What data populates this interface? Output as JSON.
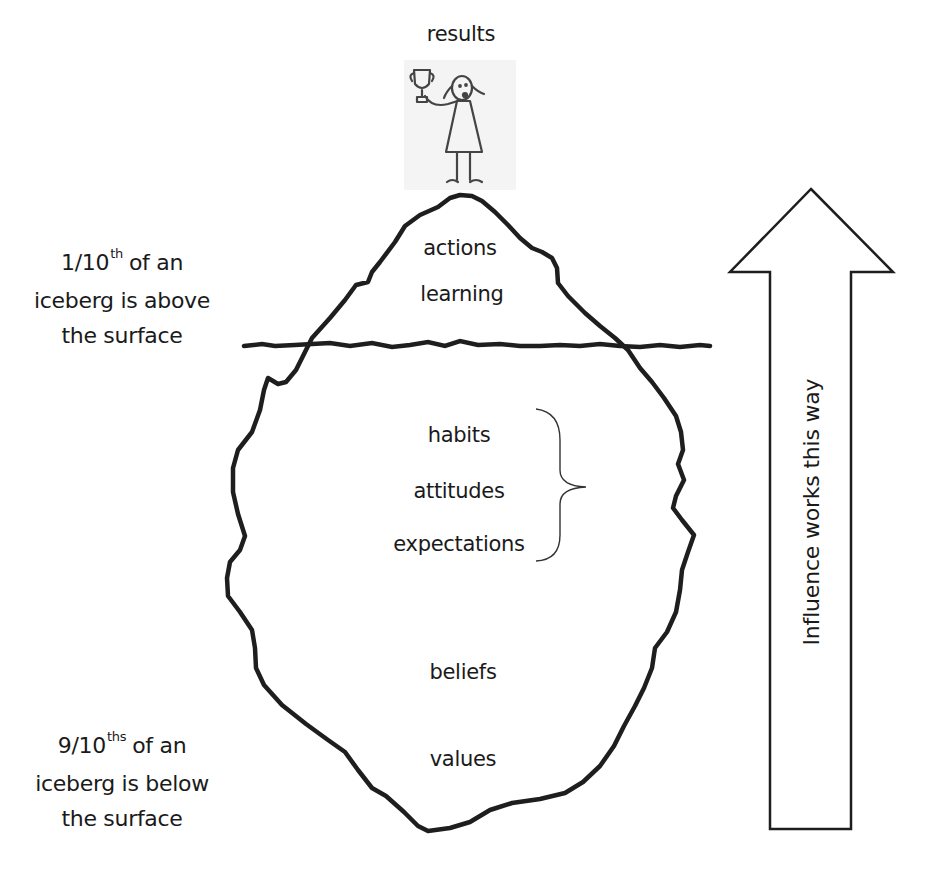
{
  "diagram": {
    "type": "iceberg-model",
    "top_label": "results",
    "above_surface": [
      "actions",
      "learning"
    ],
    "below_surface_grouped": [
      "habits",
      "attitudes",
      "expectations"
    ],
    "below_surface_deep": [
      "beliefs",
      "values"
    ],
    "above_note": {
      "fraction": "1/10",
      "suffix": "th",
      "line1_rest": "of an",
      "line2": "iceberg is above",
      "line3": "the surface"
    },
    "below_note": {
      "fraction": "9/10",
      "suffix": "ths",
      "line1_rest": "of an",
      "line2": "iceberg is below",
      "line3": "the surface"
    },
    "arrow_label": "Influence works this way",
    "arrow_direction": "up",
    "illustration": "girl-holding-trophy",
    "colors": {
      "stroke": "#1e1e1e",
      "text": "#1a1a1a",
      "background": "#ffffff",
      "figure_bg": "#f4f4f4"
    }
  }
}
